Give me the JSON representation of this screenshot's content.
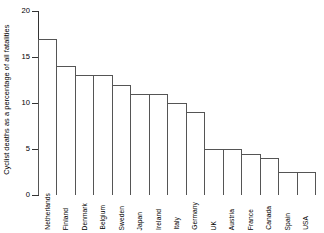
{
  "chart_data": {
    "type": "bar",
    "title": "",
    "subtitle": "",
    "xlabel": "",
    "ylabel": "Cyclist deaths as a percentage of all fatalities",
    "ylim": [
      0,
      20
    ],
    "yticks": [
      0,
      5,
      10,
      15,
      20
    ],
    "ytick_labels": [
      "0",
      "5",
      "10",
      "15",
      "20"
    ],
    "grid": false,
    "legend": false,
    "legend_position": "none",
    "categories": [
      "Netherlands",
      "Finland",
      "Denmark",
      "Belgium",
      "Sweden",
      "Japan",
      "Ireland",
      "Italy",
      "Germany",
      "UK",
      "Austria",
      "France",
      "Canada",
      "Spain",
      "USA"
    ],
    "values": [
      17,
      14,
      13,
      13,
      12,
      11,
      11,
      10,
      9,
      5,
      5,
      4.5,
      4,
      2.5,
      2.5
    ]
  },
  "axis": {
    "y_label": "Cyclist deaths as a percentage of all fatalities"
  }
}
